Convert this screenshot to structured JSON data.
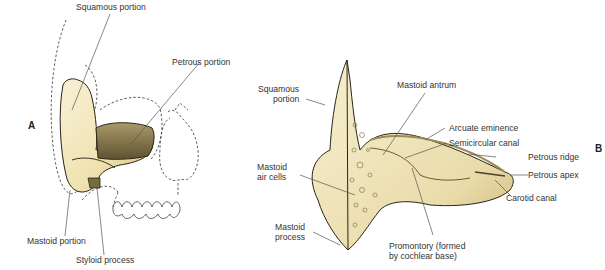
{
  "panels": {
    "A": {
      "letter": "A",
      "labels": {
        "squamous": "Squamous portion",
        "petrous": "Petrous portion",
        "mastoid": "Mastoid portion",
        "styloid": "Styloid process"
      }
    },
    "B": {
      "letter": "B",
      "labels": {
        "squamous_1": "Squamous",
        "squamous_2": "portion",
        "mastoid_antrum": "Mastoid antrum",
        "arcuate": "Arcuate eminence",
        "semicircular": "Semicircular canal",
        "petrous_ridge": "Petrous ridge",
        "petrous_apex": "Petrous apex",
        "carotid": "Carotid canal",
        "air_cells_1": "Mastoid",
        "air_cells_2": "air cells",
        "mastoid_process_1": "Mastoid",
        "mastoid_process_2": "process",
        "promontory_1": "Promontory (formed",
        "promontory_2": "by cochlear base)"
      }
    }
  },
  "colors": {
    "bone_light": "#f4ecc8",
    "bone_mid": "#e2d39a",
    "bone_dark": "#8a7a4a",
    "petrous_dark": "#6d5f3a",
    "outline": "#2a2418",
    "leader": "#555555"
  }
}
